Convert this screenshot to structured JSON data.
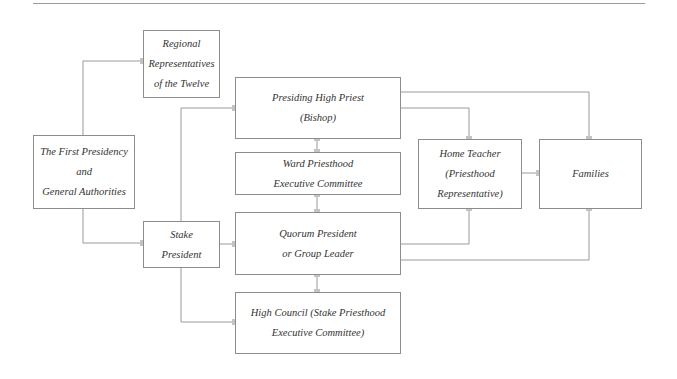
{
  "diagram": {
    "type": "organizational-chart",
    "line_color": "#9a9a9a",
    "connector_color": "#c4c4c4",
    "nodes": {
      "regional": {
        "lines": [
          "Regional",
          "Representatives",
          "of the Twelve"
        ]
      },
      "first_presidency": {
        "lines": [
          "The First Presidency",
          "and",
          "General Authorities"
        ]
      },
      "presiding_high_priest": {
        "lines": [
          "Presiding High Priest",
          "(Bishop)"
        ]
      },
      "ward_committee": {
        "lines": [
          "Ward Priesthood",
          "Executive Committee"
        ]
      },
      "stake_president": {
        "lines": [
          "Stake",
          "President"
        ]
      },
      "quorum_president": {
        "lines": [
          "Quorum President",
          "or Group Leader"
        ]
      },
      "high_council": {
        "lines": [
          "High Council (Stake Priesthood",
          "Executive Committee)"
        ]
      },
      "home_teacher": {
        "lines": [
          "Home Teacher",
          "(Priesthood",
          "Representative)"
        ]
      },
      "families": {
        "lines": [
          "Families"
        ]
      }
    },
    "edges": [
      [
        "first_presidency",
        "regional"
      ],
      [
        "first_presidency",
        "stake_president"
      ],
      [
        "stake_president",
        "presiding_high_priest"
      ],
      [
        "stake_president",
        "quorum_president"
      ],
      [
        "stake_president",
        "high_council"
      ],
      [
        "presiding_high_priest",
        "ward_committee"
      ],
      [
        "ward_committee",
        "quorum_president"
      ],
      [
        "quorum_president",
        "high_council"
      ],
      [
        "presiding_high_priest",
        "home_teacher"
      ],
      [
        "presiding_high_priest",
        "families"
      ],
      [
        "home_teacher",
        "families"
      ],
      [
        "quorum_president",
        "home_teacher"
      ],
      [
        "quorum_president",
        "families"
      ]
    ]
  }
}
